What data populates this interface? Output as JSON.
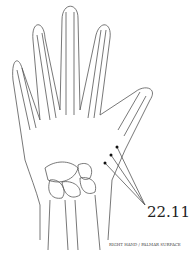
{
  "diagram": {
    "point_label": "22.11",
    "caption": "RIGHT HAND / PALMAR SURFACE",
    "points": [
      {
        "x": 117,
        "y": 147
      },
      {
        "x": 111,
        "y": 155
      },
      {
        "x": 105,
        "y": 163
      }
    ],
    "colors": {
      "line": "#555555",
      "dot": "#111111",
      "background": "#ffffff"
    }
  }
}
